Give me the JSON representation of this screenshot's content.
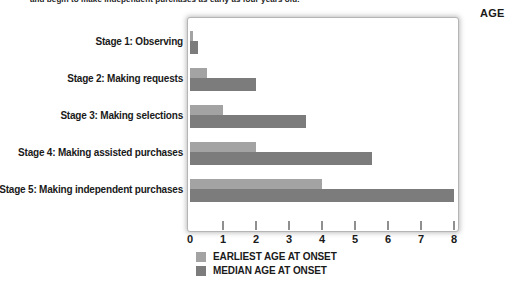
{
  "caption": "and begin to make independent purchases as early as four years old.",
  "chart_data": {
    "type": "bar",
    "orientation": "horizontal",
    "title": "",
    "xlabel": "AGE",
    "ylabel": "",
    "xlim": [
      0,
      8
    ],
    "xticks": [
      0,
      1,
      2,
      3,
      4,
      5,
      6,
      7,
      8
    ],
    "grid": false,
    "legend_position": "bottom-left",
    "categories": [
      "Stage 1: Observing",
      "Stage 2: Making requests",
      "Stage 3: Making selections",
      "Stage 4: Making assisted purchases",
      "Stage 5: Making independent purchases"
    ],
    "series": [
      {
        "name": "EARLIEST AGE AT ONSET",
        "color": "#a2a3a2",
        "values": [
          0.1,
          0.5,
          1,
          2,
          4
        ]
      },
      {
        "name": "MEDIAN AGE AT ONSET",
        "color": "#7b7c7b",
        "values": [
          0.25,
          2,
          3.5,
          5.5,
          8
        ]
      }
    ],
    "colors": {
      "earliest": "#a2a3a2",
      "median": "#7b7c7b",
      "tick": "#8f8f8f",
      "text": "#1a1a1a"
    }
  }
}
